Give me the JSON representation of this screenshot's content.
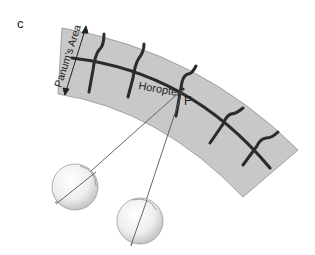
{
  "figure": {
    "panel_label": "c",
    "labels": {
      "panums_area": "Panum's Area",
      "horopter": "Horopter",
      "fixation_point": "F"
    },
    "colors": {
      "band_fill": "#c8c8c8",
      "band_edge": "#9a9a9a",
      "horopter_line": "#2b2b2b",
      "sight_line": "#555555",
      "eye_shade": "#d8d8d8"
    },
    "elements": [
      "panums-area-band",
      "horopter-curve",
      "fixation-point",
      "left-eye",
      "right-eye",
      "left-line-of-sight",
      "right-line-of-sight"
    ]
  }
}
